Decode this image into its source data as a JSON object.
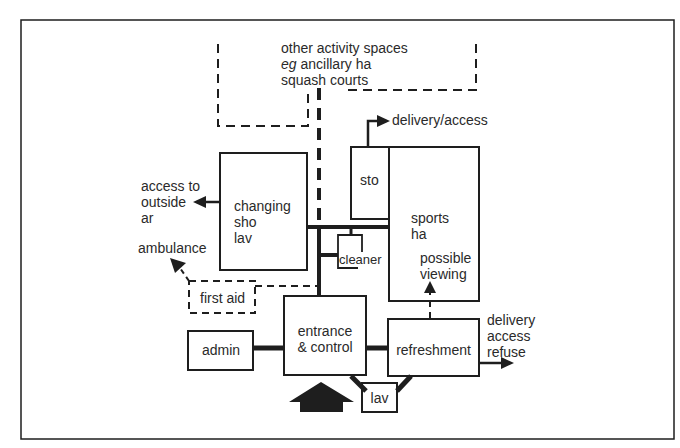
{
  "diagram": {
    "type": "space relationship diagram (sports centre)",
    "spaces": {
      "other_activity": {
        "line1": "other activity spaces",
        "line2_italic": "eg",
        "line2_rest": " ancillary ha",
        "line3": "squash courts",
        "style": "dashed"
      },
      "changing": {
        "line1": "changing",
        "line2": "sho",
        "line3": "lav"
      },
      "store": {
        "label": "sto"
      },
      "sports_hall": {
        "line1": "sports",
        "line2": "ha"
      },
      "viewing": {
        "line1": "possible",
        "line2": "viewing"
      },
      "cleaner": {
        "label": "cleaner"
      },
      "first_aid": {
        "label": "first aid",
        "style": "dashed"
      },
      "admin": {
        "label": "admin"
      },
      "entrance": {
        "line1": "entrance",
        "line2": "& control"
      },
      "refreshment": {
        "label": "refreshment"
      },
      "lav": {
        "label": "lav"
      }
    },
    "external_links": {
      "delivery_access": "delivery/access",
      "outside_area": {
        "line1": "access to",
        "line2": "outside",
        "line3": "ar"
      },
      "ambulance": "ambulance",
      "service": {
        "line1": "delivery",
        "line2": "access",
        "line3": "refuse"
      }
    },
    "entry_arrow": "main-entrance-arrow",
    "colors": {
      "line": "#1e1e1e",
      "background": "#ffffff"
    }
  }
}
